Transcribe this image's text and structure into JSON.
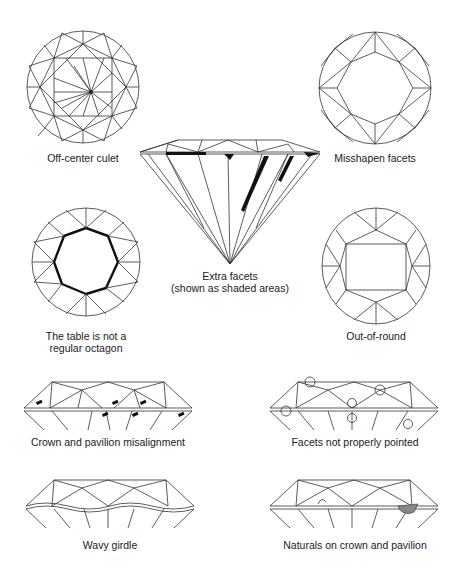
{
  "figures": [
    {
      "id": "off-center-culet",
      "caption": "Off-center culet",
      "view": "top"
    },
    {
      "id": "misshapen-facets",
      "caption": "Misshapen facets",
      "view": "top"
    },
    {
      "id": "extra-facets",
      "caption_line1": "Extra facets",
      "caption_line2": "(shown as shaded areas)",
      "view": "side"
    },
    {
      "id": "table-not-octagon",
      "caption_line1": "The table is not a",
      "caption_line2": "regular octagon",
      "view": "top"
    },
    {
      "id": "out-of-round",
      "caption": "Out-of-round",
      "view": "top"
    },
    {
      "id": "crown-pavilion-misalignment",
      "caption": "Crown and pavilion misalignment",
      "view": "side-crown"
    },
    {
      "id": "facets-not-pointed",
      "caption": "Facets not properly pointed",
      "view": "side-crown"
    },
    {
      "id": "wavy-girdle",
      "caption": "Wavy girdle",
      "view": "side-crown"
    },
    {
      "id": "naturals",
      "caption": "Naturals on crown and pavilion",
      "view": "side-crown"
    }
  ],
  "colors": {
    "line": "#333333",
    "background": "#ffffff",
    "shade": "#111111"
  }
}
